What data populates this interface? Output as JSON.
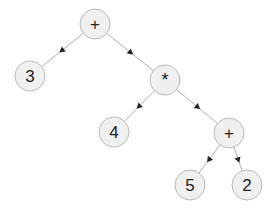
{
  "diagram": {
    "colors": {
      "node_fill": "#f0f0f0",
      "node_stroke": "#b8b8b8",
      "edge": "#9a9a9a",
      "arrow": "#222222",
      "text": "#222222"
    },
    "nodes": [
      {
        "id": "n0",
        "label": "+",
        "x": 95,
        "y": 24
      },
      {
        "id": "n1",
        "label": "3",
        "x": 30,
        "y": 76
      },
      {
        "id": "n2",
        "label": "*",
        "x": 165,
        "y": 80
      },
      {
        "id": "n3",
        "label": "4",
        "x": 114,
        "y": 132
      },
      {
        "id": "n4",
        "label": "+",
        "x": 229,
        "y": 133
      },
      {
        "id": "n5",
        "label": "5",
        "x": 190,
        "y": 185
      },
      {
        "id": "n6",
        "label": "2",
        "x": 247,
        "y": 185
      }
    ],
    "edges": [
      {
        "from": "n0",
        "to": "n1"
      },
      {
        "from": "n0",
        "to": "n2"
      },
      {
        "from": "n2",
        "to": "n3"
      },
      {
        "from": "n2",
        "to": "n4"
      },
      {
        "from": "n4",
        "to": "n5"
      },
      {
        "from": "n4",
        "to": "n6"
      }
    ]
  }
}
